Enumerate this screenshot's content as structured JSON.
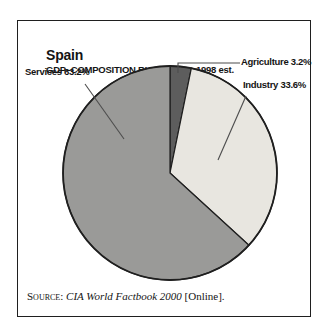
{
  "header": {
    "title": "Spain",
    "subtitle": "GDP–COMPOSITION BY SECTOR–1998 est."
  },
  "chart_data": {
    "type": "pie",
    "title": "Spain",
    "subtitle": "GDP–COMPOSITION BY SECTOR–1998 est.",
    "unit": "%",
    "start_angle_deg": 0,
    "direction": "clockwise",
    "slices": [
      {
        "label": "Agriculture",
        "value": 3.2,
        "color": "#5d5d5d"
      },
      {
        "label": "Industry",
        "value": 33.6,
        "color": "#e8e6e0"
      },
      {
        "label": "Services",
        "value": 63.2,
        "color": "#9a9a98"
      }
    ],
    "outline_color": "#1f1f1f",
    "leader_line_color": "#4d4d4d"
  },
  "labels": {
    "services": "Services 63.2%",
    "agriculture": "Agriculture 3.2%",
    "industry": "Industry 33.6%"
  },
  "source": {
    "prefix": "Source: ",
    "work": "CIA World Factbook 2000",
    "suffix": " [Online]."
  }
}
